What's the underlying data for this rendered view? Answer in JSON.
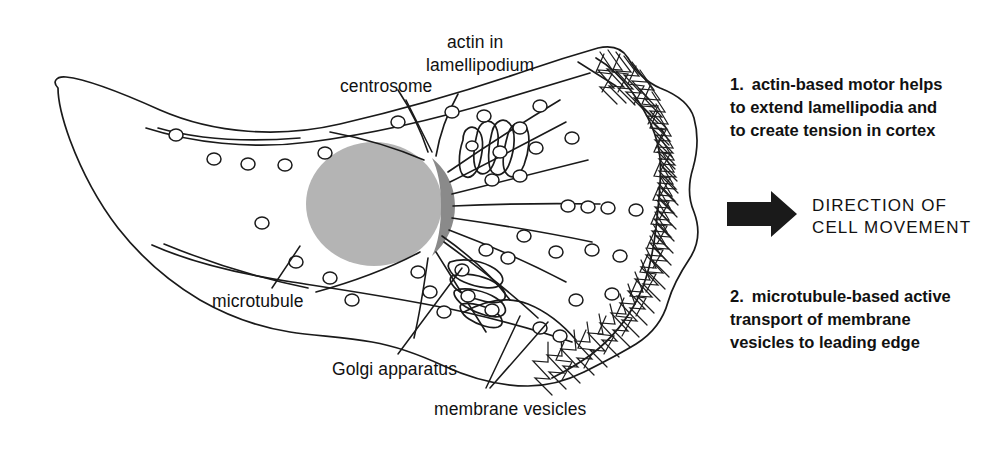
{
  "figure": {
    "background_color": "#ffffff",
    "ink_color": "#1a1a1a",
    "nucleus_color": "#b4b4b4",
    "centrosome_color": "#8a8a8a",
    "arrow_color": "#1a1a1a"
  },
  "labels": [
    {
      "id": "actin-in-lamellipodium",
      "line1": "actin in",
      "line2": "lamellipodium"
    },
    {
      "id": "centrosome",
      "text": "centrosome"
    },
    {
      "id": "microtubule",
      "text": "microtubule"
    },
    {
      "id": "golgi-apparatus",
      "text": "Golgi apparatus"
    },
    {
      "id": "membrane-vesicles",
      "text": "membrane vesicles"
    }
  ],
  "notes": [
    {
      "id": "note-1",
      "number": "1.",
      "line1": "actin-based motor helps",
      "line2": "to extend lamellipodia and",
      "line3": "to create tension in cortex"
    },
    {
      "id": "note-2",
      "number": "2.",
      "line1": "microtubule-based active",
      "line2": "transport of membrane",
      "line3": "vesicles to leading edge"
    }
  ],
  "direction": {
    "id": "direction-of-cell-movement",
    "line1": "DIRECTION OF",
    "line2": "CELL MOVEMENT",
    "arrow_icon": "arrow-right-icon"
  }
}
